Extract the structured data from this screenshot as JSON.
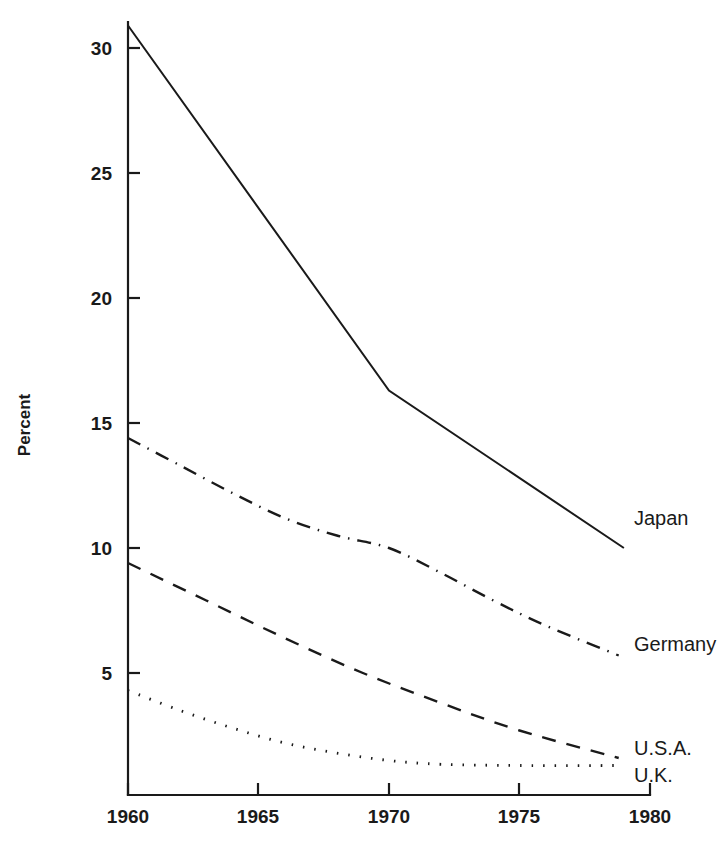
{
  "chart_data": {
    "type": "line",
    "title": "",
    "xlabel": "",
    "ylabel": "Percent",
    "xlim": [
      1960,
      1980
    ],
    "ylim": [
      0,
      31.5
    ],
    "xticks": [
      1960,
      1965,
      1970,
      1975,
      1980
    ],
    "xticklabels": [
      "1960",
      "1965",
      "1970",
      "1975",
      "1980"
    ],
    "yticks": [
      5,
      10,
      15,
      20,
      25,
      30
    ],
    "yticklabels": [
      "5",
      "10",
      "15",
      "20",
      "25",
      "30"
    ],
    "grid": false,
    "legend_position": "inline-right-of-line-ends",
    "series": [
      {
        "name": "Japan",
        "label": "Japan",
        "linestyle": "solid",
        "color": "#1a1a1a",
        "x": [
          1960,
          1970,
          1979
        ],
        "values": [
          30.9,
          16.3,
          10.0
        ]
      },
      {
        "name": "Germany",
        "label": "Germany",
        "linestyle": "dash-dot",
        "color": "#1a1a1a",
        "x": [
          1960,
          1962,
          1964,
          1966,
          1968,
          1970,
          1972,
          1974,
          1976,
          1978.8
        ],
        "values": [
          14.4,
          13.3,
          12.2,
          11.2,
          10.5,
          10.0,
          9.0,
          7.9,
          6.9,
          5.7
        ]
      },
      {
        "name": "U.S.A.",
        "label": "U.S.A.",
        "linestyle": "dashed",
        "color": "#1a1a1a",
        "x": [
          1960,
          1963,
          1966,
          1969,
          1972,
          1975,
          1978.8
        ],
        "values": [
          9.4,
          7.9,
          6.4,
          5.0,
          3.8,
          2.7,
          1.6
        ]
      },
      {
        "name": "U.K.",
        "label": "U.K.",
        "linestyle": "dotted",
        "color": "#1a1a1a",
        "x": [
          1960,
          1962,
          1964,
          1966,
          1968,
          1970,
          1972,
          1975,
          1978.8
        ],
        "values": [
          4.3,
          3.5,
          2.8,
          2.2,
          1.8,
          1.5,
          1.35,
          1.3,
          1.3
        ]
      }
    ]
  },
  "axis": {
    "y_title": "Percent",
    "x_tick_1": "1960",
    "x_tick_2": "1965",
    "x_tick_3": "1970",
    "x_tick_4": "1975",
    "x_tick_5": "1980",
    "y_tick_5": "5",
    "y_tick_10": "10",
    "y_tick_15": "15",
    "y_tick_20": "20",
    "y_tick_25": "25",
    "y_tick_30": "30"
  },
  "labels": {
    "japan": "Japan",
    "germany": "Germany",
    "usa": "U.S.A.",
    "uk": "U.K."
  },
  "colors": {
    "ink": "#1a1a1a",
    "background": "#ffffff"
  }
}
